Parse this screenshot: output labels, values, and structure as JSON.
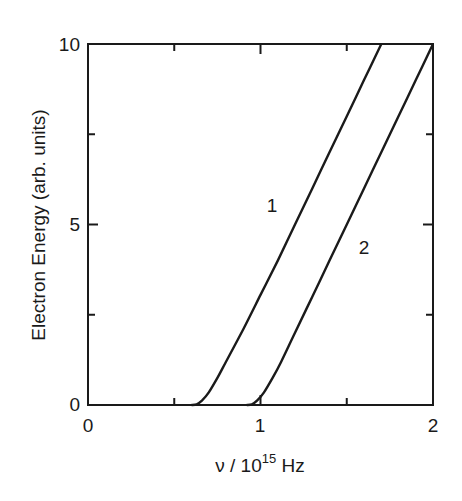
{
  "chart_data": {
    "type": "line",
    "title": "",
    "xlabel": "ν / 10^15 Hz",
    "xlabel_parts": {
      "main": "ν / 10",
      "sup": "15",
      "unit": " Hz"
    },
    "ylabel": "Electron Energy (arb. units)",
    "xlim": [
      0,
      2
    ],
    "ylim": [
      0,
      10
    ],
    "x_ticks": [
      0,
      1,
      2
    ],
    "x_minor_ticks": [
      0.5,
      1.5
    ],
    "y_ticks": [
      0,
      5,
      10
    ],
    "y_minor_ticks": [
      2.5,
      7.5
    ],
    "grid": false,
    "legend": "none (curves labeled inline)",
    "series": [
      {
        "name": "1",
        "label_position": {
          "x": 1.05,
          "y": 5.5
        },
        "x": [
          0.6,
          0.63,
          0.66,
          0.7,
          0.75,
          0.8,
          0.9,
          1.0,
          1.1,
          1.2,
          1.3,
          1.4,
          1.5,
          1.6,
          1.7
        ],
        "y": [
          0.0,
          0.02,
          0.12,
          0.35,
          0.75,
          1.2,
          2.1,
          3.05,
          4.0,
          5.0,
          6.0,
          7.0,
          8.0,
          9.0,
          10.0
        ]
      },
      {
        "name": "2",
        "label_position": {
          "x": 1.6,
          "y": 4.3
        },
        "x": [
          0.92,
          0.95,
          0.98,
          1.02,
          1.07,
          1.12,
          1.2,
          1.3,
          1.4,
          1.5,
          1.6,
          1.7,
          1.8,
          1.9,
          2.0
        ],
        "y": [
          0.0,
          0.02,
          0.12,
          0.35,
          0.75,
          1.2,
          2.0,
          3.0,
          4.0,
          5.0,
          6.0,
          7.0,
          8.0,
          9.0,
          10.0
        ]
      }
    ]
  },
  "labels": {
    "x_tick_0": "0",
    "x_tick_1": "1",
    "x_tick_2": "2",
    "y_tick_0": "0",
    "y_tick_5": "5",
    "y_tick_10": "10",
    "curve_1": "1",
    "curve_2": "2",
    "ylabel": "Electron Energy (arb. units)",
    "xlabel_main": "ν / 10",
    "xlabel_sup": "15",
    "xlabel_unit": " Hz"
  },
  "colors": {
    "line": "#1a1a1a",
    "background": "#ffffff"
  }
}
